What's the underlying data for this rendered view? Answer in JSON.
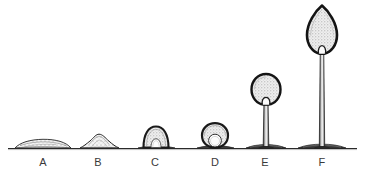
{
  "figure": {
    "caption": "",
    "ink_color": "#1a1a1a",
    "fill_color": "#f2f2f2",
    "stipple_color": "#8a8a8a",
    "background_color": "#ffffff",
    "label_color": "#3a3a3a",
    "ground_line": {
      "name": "ground-line",
      "y": 148,
      "x_start": 8,
      "x_end": 357
    }
  },
  "stages": [
    {
      "id": "A",
      "label": "A",
      "label_x": 43,
      "label_y": 158,
      "center_x": 43,
      "description": "flat elongated mound on substrate",
      "head_height": 7,
      "head_width": 56,
      "stalk_height": 0,
      "has_stalk": false,
      "has_basal_cavity": false
    },
    {
      "id": "B",
      "label": "B",
      "label_x": 98,
      "label_y": 158,
      "center_x": 99,
      "description": "raised rounded hemispherical mound",
      "head_height": 14,
      "head_width": 34,
      "stalk_height": 0,
      "has_stalk": false,
      "has_basal_cavity": false
    },
    {
      "id": "C",
      "label": "C",
      "label_x": 155,
      "label_y": 158,
      "center_x": 156,
      "description": "dome with dark rim and arched basal cavity",
      "head_height": 22,
      "head_width": 26,
      "stalk_height": 0,
      "has_stalk": false,
      "has_basal_cavity": true
    },
    {
      "id": "D",
      "label": "D",
      "label_x": 215,
      "label_y": 158,
      "center_x": 215,
      "description": "globose body with circular basal cavity forming stalk",
      "head_height": 24,
      "head_width": 27,
      "stalk_height": 0,
      "has_stalk": false,
      "has_basal_cavity": true
    },
    {
      "id": "E",
      "label": "E",
      "label_x": 265,
      "label_y": 158,
      "center_x": 266,
      "description": "spherical head elevated on short slender stalk",
      "head_height": 30,
      "head_width": 30,
      "stalk_height": 44,
      "has_stalk": true,
      "has_basal_cavity": false
    },
    {
      "id": "F",
      "label": "F",
      "label_x": 322,
      "label_y": 158,
      "center_x": 322,
      "description": "elongate ovoid head on tall slender stalk",
      "head_height": 48,
      "head_width": 30,
      "stalk_height": 92,
      "has_stalk": true,
      "has_basal_cavity": false
    }
  ]
}
